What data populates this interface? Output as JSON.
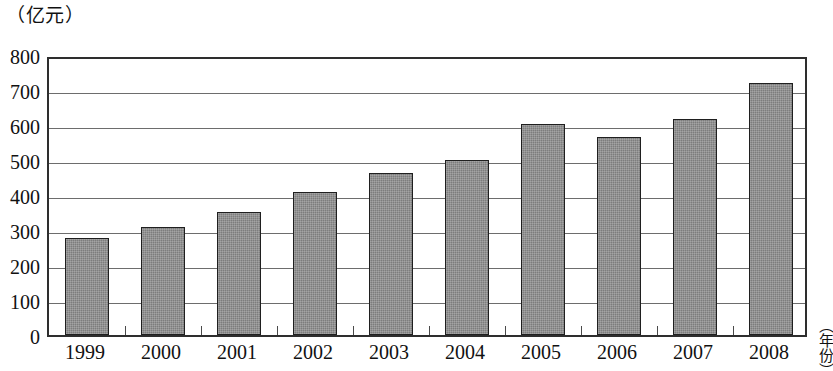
{
  "chart_data": {
    "type": "bar",
    "title": "",
    "unit_label": "（亿元）",
    "xlabel": "（年份）",
    "ylabel": "亿元",
    "categories": [
      "1999",
      "2000",
      "2001",
      "2002",
      "2003",
      "2004",
      "2005",
      "2006",
      "2007",
      "2008"
    ],
    "values": [
      278,
      310,
      352,
      408,
      463,
      500,
      604,
      565,
      617,
      720
    ],
    "ylim": [
      0,
      800
    ],
    "ytick_labels": [
      "800",
      "700",
      "600",
      "500",
      "400",
      "300",
      "200",
      "100",
      "0"
    ],
    "ytick_values": [
      800,
      700,
      600,
      500,
      400,
      300,
      200,
      100,
      0
    ],
    "grid": true,
    "legend": "none",
    "bar_color": "#7d7d7d",
    "bar_edge_color": "#1f1f1f",
    "axis_color": "#2e2e2e",
    "gridline_color": "#6d6d6d"
  }
}
